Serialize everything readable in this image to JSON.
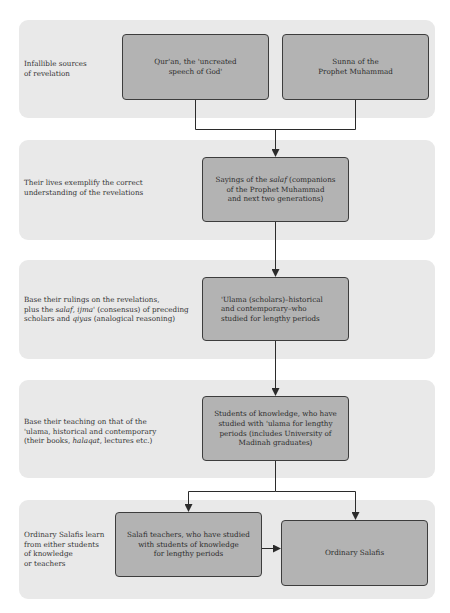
{
  "panels": [
    {
      "label_lines": [
        "Infallible sources",
        "of  revelation"
      ],
      "boxes": [
        {
          "lines": [
            "Qur'an, the 'uncreated",
            "speech of God'"
          ]
        },
        {
          "lines": [
            "Sunna of the",
            "Prophet Muhammad"
          ]
        }
      ]
    },
    {
      "label_lines": [
        "Their lives exemplify the correct",
        "understanding of the revelations"
      ],
      "boxes": [
        {
          "lines": [
            "Sayings of the salaf (companions",
            "of the Prophet Muhammad",
            "and next two generations)"
          ]
        }
      ]
    },
    {
      "label_lines": [
        "Base their rulings on the revelations,",
        "plus the salaf, ijma' (consensus) of preceding",
        "scholars and qiyas (analogical reasoning)"
      ],
      "boxes": [
        {
          "lines": [
            "'Ulama (scholars)–historical",
            "and contemporary–who",
            "studied for lengthy periods"
          ]
        }
      ]
    },
    {
      "label_lines": [
        "Base their teaching on that of the",
        "'ulama, historical and contemporary",
        "(their books, halaqat, lectures etc.)"
      ],
      "boxes": [
        {
          "lines": [
            "Students of knowledge, who have",
            "studied with 'ulama for lengthy",
            "periods (includes University of",
            "Madinah graduates)"
          ]
        }
      ]
    },
    {
      "label_lines": [
        "Ordinary Salafis learn",
        "from either students",
        "of knowledge",
        "or teachers"
      ],
      "boxes": [
        {
          "lines": [
            "Salafi teachers, who have studied",
            "with students of knowledge",
            "for lengthy periods"
          ]
        },
        {
          "lines": [
            "Ordinary Salafis"
          ]
        }
      ]
    }
  ],
  "colors": {
    "panel_bg": "#e9e9e9",
    "box_fill": "#b3b3b3",
    "box_border": "#3d3d3d",
    "connector": "#2b2b2b"
  }
}
